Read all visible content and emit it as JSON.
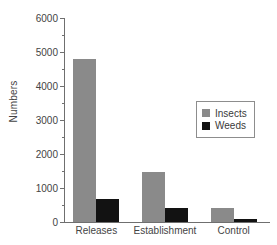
{
  "chart_data": {
    "type": "bar",
    "title": "",
    "xlabel": "",
    "ylabel": "Numbers",
    "categories": [
      "Releases",
      "Establishment",
      "Control"
    ],
    "series": [
      {
        "name": "Insects",
        "color": "#8a8a8a",
        "values": [
          4800,
          1470,
          410
        ]
      },
      {
        "name": "Weeds",
        "color": "#121212",
        "values": [
          680,
          410,
          90
        ]
      }
    ],
    "ylim": [
      0,
      6000
    ],
    "ytick_labels": [
      "0",
      "1000",
      "2000",
      "3000",
      "4000",
      "5000",
      "6000"
    ],
    "ytick_values": [
      0,
      1000,
      2000,
      3000,
      4000,
      5000,
      6000
    ],
    "yminor_values": [
      500,
      1500,
      2500,
      3500,
      4500,
      5500
    ],
    "grid": false,
    "legend_position": "upper right",
    "legend_entries": [
      "Insects",
      "Weeds"
    ]
  }
}
